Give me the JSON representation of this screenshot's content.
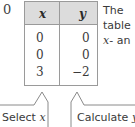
{
  "step_number": "0",
  "table": {
    "headers": [
      "x",
      "y"
    ],
    "rows": [
      [
        "0",
        "0"
      ],
      [
        "0",
        "0"
      ],
      [
        "3",
        "−2"
      ]
    ],
    "header_bg": "#dcdcdc",
    "border_color": "#9a9a9a"
  },
  "side_text": {
    "line1": "The",
    "line2": "table",
    "line3_var": "x",
    "line3_rest": "- an"
  },
  "callouts": [
    {
      "text": "Select ",
      "var": "x"
    },
    {
      "text": "Calculate ",
      "var": "y"
    }
  ]
}
